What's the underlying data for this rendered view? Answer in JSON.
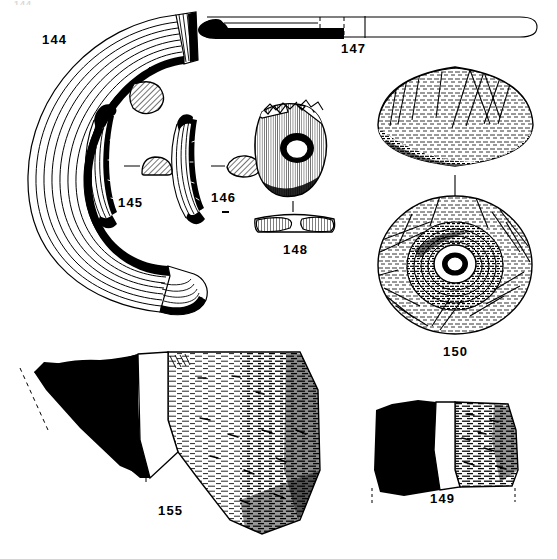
{
  "plate": {
    "running_head": "144",
    "caption": "",
    "background_color": "#ffffff",
    "ink_color": "#000000",
    "width": 557,
    "height": 559
  },
  "figures": [
    {
      "number": "144",
      "label": "144",
      "object": "large ribbed annular ring / bracelet, near-complete C-shaped arc",
      "label_x": 42,
      "label_y": 33,
      "section_label": "hatched oval cross-section"
    },
    {
      "number": "145",
      "label": "145",
      "object": "curved ribbed bracelet fragment with blackened terminal",
      "label_x": 118,
      "label_y": 196,
      "section_label": "hatched D-shaped cross-section"
    },
    {
      "number": "146",
      "label": "146",
      "object": "curved ribbed bracelet fragment",
      "label_x": 211,
      "label_y": 196,
      "section_label": "hatched lenticular cross-section"
    },
    {
      "number": "147",
      "label": "147",
      "object": "elongated blade / knife with solid black hooked tip and outlined handle, dashed break line",
      "label_x": 341,
      "label_y": 42
    },
    {
      "number": "148",
      "label": "148",
      "object": "perforated disc (spindle whorl) with central hole, plus profile section below",
      "label_x": 287,
      "label_y": 245,
      "section_label": "flat profile section with vertical hatching"
    },
    {
      "number": "149",
      "label": "149",
      "object": "pottery sherd - blackened profile at left, hatched exterior surface at right",
      "label_x": 434,
      "label_y": 496
    },
    {
      "number": "150",
      "label": "150",
      "object": "rotary quern upper stone - side elevation above, perforated top view below",
      "label_x": 449,
      "label_y": 345
    },
    {
      "number": "155",
      "label": "155",
      "object": "large pottery sherd - blackened profile at left, hatched exterior surface at right",
      "label_x": 160,
      "label_y": 506
    }
  ]
}
